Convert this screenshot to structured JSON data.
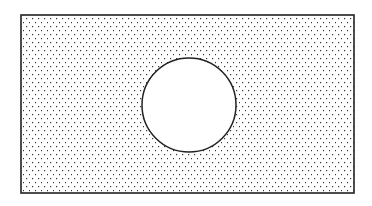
{
  "diagram": {
    "background": "#ffffff",
    "stroke_color": "#222222",
    "dot_color": "#333333",
    "rectangle": {
      "x": 21,
      "y": 15,
      "width": 333,
      "height": 178,
      "fill_pattern": "dot-stipple"
    },
    "circle": {
      "cx": 189,
      "cy": 105,
      "r": 47,
      "fill": "#ffffff"
    }
  }
}
